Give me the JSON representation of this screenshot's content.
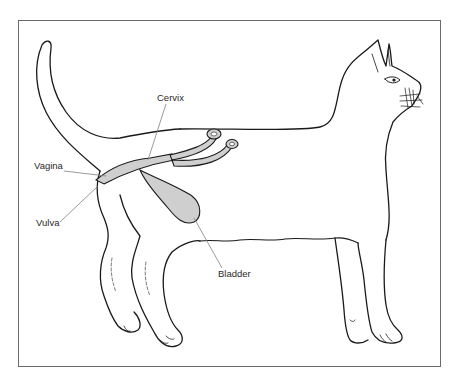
{
  "figure": {
    "colors": {
      "outline": "#1a1a1a",
      "organ_fill": "#cfcfcf",
      "leader_line": "#808080",
      "frame": "#6a6a6a",
      "label": "#2a2a2a"
    },
    "labels": {
      "cervix": "Cervix",
      "vagina": "Vagina",
      "vulva": "Vulva",
      "bladder": "Bladder"
    }
  }
}
